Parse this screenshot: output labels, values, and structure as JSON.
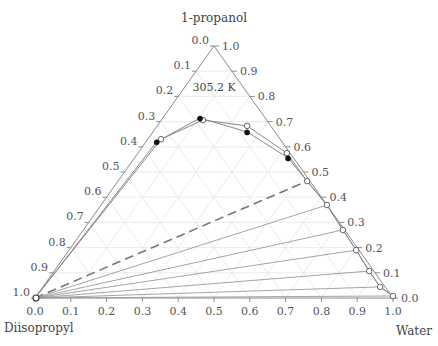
{
  "chart_data": {
    "type": "scatter",
    "subtype": "ternary",
    "title": "",
    "annotation": "305.2 K",
    "vertices": {
      "top": "1-propanol",
      "bottom_left": "Diisopropyl",
      "bottom_right": "Water"
    },
    "axes": {
      "bottom": {
        "component": "Water",
        "ticks": [
          "0.0",
          "0.1",
          "0.2",
          "0.3",
          "0.4",
          "0.5",
          "0.6",
          "0.7",
          "0.8",
          "0.9",
          "1.0"
        ]
      },
      "right": {
        "component": "1-propanol",
        "ticks": [
          "0.0",
          "0.1",
          "0.2",
          "0.3",
          "0.4",
          "0.5",
          "0.6",
          "0.7",
          "0.8",
          "0.9",
          "1.0"
        ]
      },
      "left": {
        "component": "Diisopropyl",
        "ticks": [
          "0.0",
          "0.1",
          "0.2",
          "0.3",
          "0.4",
          "0.5",
          "0.6",
          "0.7",
          "0.8",
          "0.9",
          "1.0"
        ]
      }
    },
    "grid": true,
    "grid_step": 0.1,
    "series": [
      {
        "name": "experimental (open)",
        "marker": "open-circle",
        "points_water_propanol": [
          [
            0.0,
            0.0
          ],
          [
            0.037,
            0.63
          ],
          [
            0.116,
            0.706
          ],
          [
            0.251,
            0.683
          ],
          [
            0.416,
            0.575
          ],
          [
            0.528,
            0.464
          ],
          [
            0.631,
            0.369
          ],
          [
            0.725,
            0.27
          ],
          [
            0.802,
            0.19
          ],
          [
            0.88,
            0.107
          ],
          [
            0.942,
            0.044
          ],
          [
            0.996,
            0.008
          ]
        ]
      },
      {
        "name": "calculated (filled)",
        "marker": "filled-circle",
        "points_water_propanol": [
          [
            0.0,
            0.0
          ],
          [
            0.03,
            0.62
          ],
          [
            0.104,
            0.714
          ],
          [
            0.263,
            0.659
          ],
          [
            0.429,
            0.556
          ],
          [
            0.528,
            0.464
          ],
          [
            0.631,
            0.369
          ],
          [
            0.725,
            0.27
          ],
          [
            0.802,
            0.19
          ],
          [
            0.88,
            0.107
          ],
          [
            0.942,
            0.044
          ],
          [
            0.996,
            0.008
          ]
        ]
      }
    ],
    "tie_lines": [
      {
        "from": [
          0.0,
          0.0
        ],
        "to": [
          0.528,
          0.464
        ],
        "style": "dashed"
      },
      {
        "from": [
          0.0,
          0.0
        ],
        "to": [
          0.631,
          0.369
        ],
        "style": "solid"
      },
      {
        "from": [
          0.0,
          0.0
        ],
        "to": [
          0.725,
          0.27
        ],
        "style": "solid"
      },
      {
        "from": [
          0.0,
          0.0
        ],
        "to": [
          0.802,
          0.19
        ],
        "style": "solid"
      },
      {
        "from": [
          0.0,
          0.0
        ],
        "to": [
          0.88,
          0.107
        ],
        "style": "solid"
      },
      {
        "from": [
          0.0,
          0.0
        ],
        "to": [
          0.942,
          0.044
        ],
        "style": "solid"
      },
      {
        "from": [
          0.0,
          0.0
        ],
        "to": [
          0.996,
          0.008
        ],
        "style": "solid"
      }
    ],
    "colors": {
      "frame": "#8a8a8a",
      "grid": "#e6e6e6",
      "tie_line": "#9a9a9a",
      "dashed": "#777777",
      "curve": "#888888",
      "marker_fill": "#111111"
    }
  }
}
